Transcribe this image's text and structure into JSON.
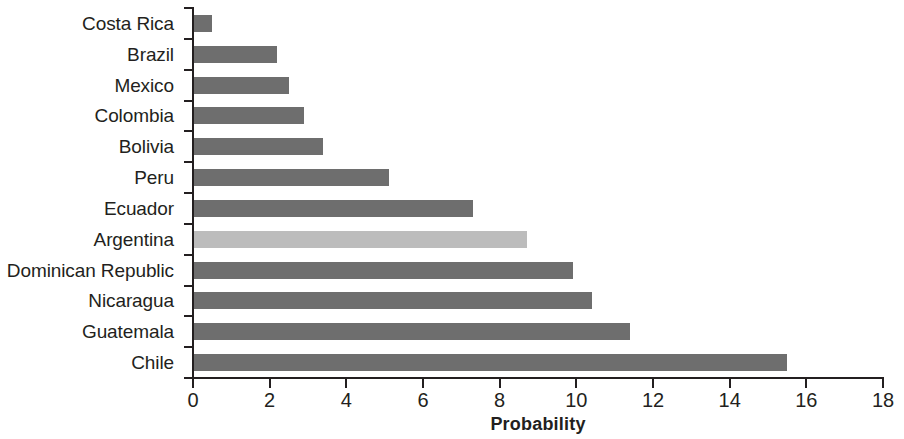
{
  "chart_data": {
    "type": "bar",
    "orientation": "horizontal",
    "title": "",
    "xlabel": "Probability",
    "ylabel": "",
    "xlim": [
      0,
      18
    ],
    "xticks": [
      0,
      2,
      4,
      6,
      8,
      10,
      12,
      14,
      16,
      18
    ],
    "xtick_labels": [
      "0",
      "2",
      "4",
      "6",
      "8",
      "10",
      "12",
      "14",
      "16",
      "18"
    ],
    "grid": false,
    "legend": false,
    "categories": [
      "Costa Rica",
      "Brazil",
      "Mexico",
      "Colombia",
      "Bolivia",
      "Peru",
      "Ecuador",
      "Argentina",
      "Dominican Republic",
      "Nicaragua",
      "Guatemala",
      "Chile"
    ],
    "values": [
      0.5,
      2.2,
      2.5,
      2.9,
      3.4,
      5.1,
      7.3,
      8.7,
      9.9,
      10.4,
      11.4,
      15.5
    ],
    "highlighted_category": "Argentina",
    "colors": {
      "bar": "#6e6e6e",
      "bar_highlight": "#bcbcbc",
      "axis": "#231f20",
      "text": "#231f20",
      "background": "#ffffff"
    },
    "bars": [
      {
        "category": "Costa Rica",
        "value": 0.5,
        "highlight": false
      },
      {
        "category": "Brazil",
        "value": 2.2,
        "highlight": false
      },
      {
        "category": "Mexico",
        "value": 2.5,
        "highlight": false
      },
      {
        "category": "Colombia",
        "value": 2.9,
        "highlight": false
      },
      {
        "category": "Bolivia",
        "value": 3.4,
        "highlight": false
      },
      {
        "category": "Peru",
        "value": 5.1,
        "highlight": false
      },
      {
        "category": "Ecuador",
        "value": 7.3,
        "highlight": false
      },
      {
        "category": "Argentina",
        "value": 8.7,
        "highlight": true
      },
      {
        "category": "Dominican Republic",
        "value": 9.9,
        "highlight": false
      },
      {
        "category": "Nicaragua",
        "value": 10.4,
        "highlight": false
      },
      {
        "category": "Guatemala",
        "value": 11.4,
        "highlight": false
      },
      {
        "category": "Chile",
        "value": 15.5,
        "highlight": false
      }
    ]
  }
}
